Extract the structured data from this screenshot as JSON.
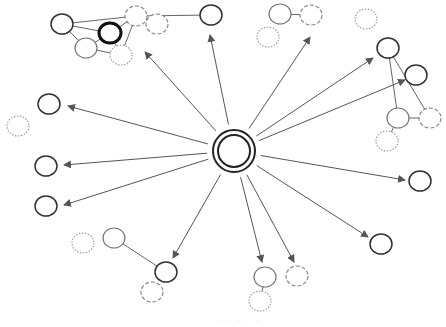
{
  "diagram": {
    "type": "hub-and-spoke network",
    "colors": {
      "background": "#ffffff",
      "arrow": "#555555",
      "edge": "#666666",
      "node_solid": "#333333",
      "node_light": "#777777",
      "node_dashed": "#888888",
      "node_dotted": "#999999"
    },
    "hub": {
      "id": "hub",
      "x": 234,
      "y": 151,
      "r_outer": 21,
      "r_inner": 16
    },
    "nodes": [
      {
        "id": "tl-a",
        "x": 62,
        "y": 24,
        "style": "solid"
      },
      {
        "id": "tl-b",
        "x": 110,
        "y": 33,
        "style": "bold"
      },
      {
        "id": "tl-c",
        "x": 86,
        "y": 48,
        "style": "light"
      },
      {
        "id": "tl-d",
        "x": 136,
        "y": 16,
        "style": "dashed"
      },
      {
        "id": "tl-e",
        "x": 157,
        "y": 24,
        "style": "dashed"
      },
      {
        "id": "tl-f",
        "x": 121,
        "y": 55,
        "style": "dotted"
      },
      {
        "id": "t-g",
        "x": 211,
        "y": 15,
        "style": "solid"
      },
      {
        "id": "tr-a",
        "x": 280,
        "y": 14,
        "style": "light"
      },
      {
        "id": "tr-b",
        "x": 311,
        "y": 15,
        "style": "dashed"
      },
      {
        "id": "tr-c",
        "x": 268,
        "y": 37,
        "style": "dotted"
      },
      {
        "id": "tr-d",
        "x": 366,
        "y": 19,
        "style": "dotted"
      },
      {
        "id": "r-a",
        "x": 388,
        "y": 48,
        "style": "solid"
      },
      {
        "id": "r-b",
        "x": 416,
        "y": 75,
        "style": "solid"
      },
      {
        "id": "r-c",
        "x": 398,
        "y": 118,
        "style": "light"
      },
      {
        "id": "r-d",
        "x": 430,
        "y": 118,
        "style": "dashed"
      },
      {
        "id": "r-e",
        "x": 387,
        "y": 141,
        "style": "dotted"
      },
      {
        "id": "l-a",
        "x": 49,
        "y": 104,
        "style": "solid"
      },
      {
        "id": "l-b",
        "x": 18,
        "y": 126,
        "style": "dotted"
      },
      {
        "id": "l-c",
        "x": 46,
        "y": 166,
        "style": "solid"
      },
      {
        "id": "l-d",
        "x": 46,
        "y": 206,
        "style": "solid"
      },
      {
        "id": "rr-a",
        "x": 420,
        "y": 181,
        "style": "solid"
      },
      {
        "id": "rr-b",
        "x": 381,
        "y": 244,
        "style": "solid"
      },
      {
        "id": "b-a",
        "x": 114,
        "y": 238,
        "style": "light"
      },
      {
        "id": "b-b",
        "x": 83,
        "y": 243,
        "style": "dotted"
      },
      {
        "id": "b-c",
        "x": 166,
        "y": 272,
        "style": "solid"
      },
      {
        "id": "b-d",
        "x": 152,
        "y": 292,
        "style": "dashed"
      },
      {
        "id": "bm-a",
        "x": 265,
        "y": 277,
        "style": "light"
      },
      {
        "id": "bm-b",
        "x": 297,
        "y": 276,
        "style": "dashed"
      },
      {
        "id": "bm-c",
        "x": 260,
        "y": 301,
        "style": "dotted"
      }
    ],
    "edges": [
      [
        "tl-a",
        "tl-b"
      ],
      [
        "tl-a",
        "tl-c"
      ],
      [
        "tl-a",
        "tl-d"
      ],
      [
        "tl-b",
        "tl-c"
      ],
      [
        "tl-b",
        "tl-d"
      ],
      [
        "tl-c",
        "tl-f"
      ],
      [
        "tl-d",
        "tl-f"
      ],
      [
        "tl-b",
        "tl-f"
      ],
      [
        "tl-d",
        "t-g"
      ],
      [
        "tr-a",
        "tr-b"
      ],
      [
        "r-a",
        "r-c"
      ],
      [
        "r-a",
        "r-d"
      ],
      [
        "r-c",
        "r-d"
      ],
      [
        "r-c",
        "r-e"
      ],
      [
        "b-a",
        "b-c"
      ],
      [
        "bm-a",
        "bm-c"
      ]
    ],
    "arrows": [
      {
        "to_x": 145,
        "to_y": 52
      },
      {
        "to_x": 210,
        "to_y": 35
      },
      {
        "to_x": 310,
        "to_y": 37
      },
      {
        "to_x": 373,
        "to_y": 58
      },
      {
        "to_x": 405,
        "to_y": 80
      },
      {
        "to_x": 68,
        "to_y": 106
      },
      {
        "to_x": 64,
        "to_y": 165
      },
      {
        "to_x": 64,
        "to_y": 205
      },
      {
        "to_x": 405,
        "to_y": 180
      },
      {
        "to_x": 368,
        "to_y": 237
      },
      {
        "to_x": 173,
        "to_y": 258
      },
      {
        "to_x": 262,
        "to_y": 262
      },
      {
        "to_x": 294,
        "to_y": 262
      }
    ],
    "caption_fragment": "· · ·   · ·"
  }
}
